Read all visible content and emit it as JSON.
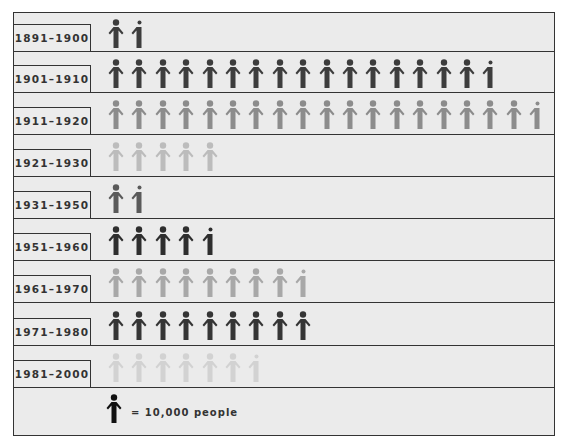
{
  "chart_data": {
    "type": "pictogram",
    "title": "",
    "unit_label": "= 10,000 people",
    "unit_value": 10000,
    "categories": [
      "1891–1900",
      "1901–1910",
      "1911–1920",
      "1921–1930",
      "1931–1950",
      "1951–1960",
      "1961–1970",
      "1971–1980",
      "1981–2000"
    ],
    "values_in_icons": [
      1.5,
      16.5,
      18.5,
      5,
      1.5,
      4.5,
      8.5,
      9,
      6.5
    ],
    "values": [
      15000,
      165000,
      185000,
      50000,
      15000,
      45000,
      85000,
      90000,
      65000
    ],
    "icon_colors": [
      "#3d3d3d",
      "#3d3d3d",
      "#8c8c8c",
      "#bcbcbc",
      "#5a5a5a",
      "#2e2e2e",
      "#a8a8a8",
      "#353535",
      "#d2d2d2"
    ]
  },
  "legend": {
    "icon": "person-icon",
    "text": "= 10,000 people",
    "icon_color": "#111111"
  }
}
